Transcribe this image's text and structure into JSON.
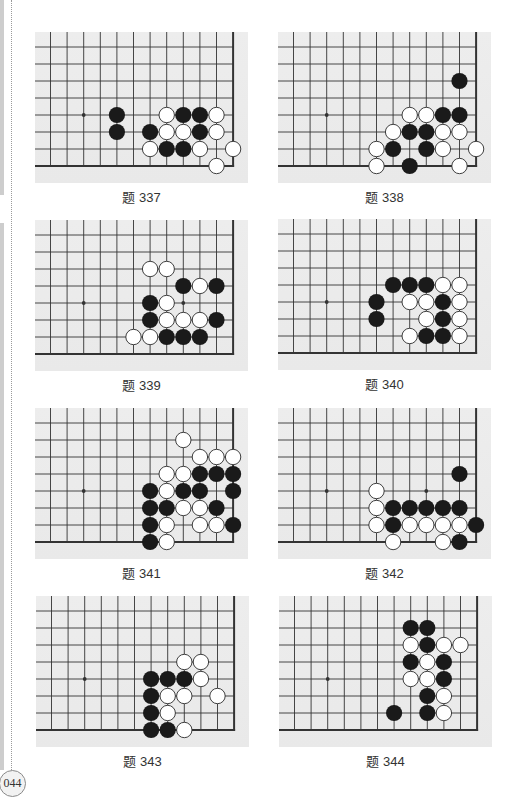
{
  "page": {
    "number": "044"
  },
  "colors": {
    "board": "#ebebeb",
    "line": "#333333",
    "black_stone": "#1a1a1a",
    "white_stone": "#ffffff",
    "stone_outline": "#2a2a2a"
  },
  "board_spec": {
    "columns": 12,
    "rows": 8,
    "edges": [
      "right",
      "bottom"
    ],
    "star_points": [
      [
        2,
        4
      ],
      [
        8,
        4
      ]
    ]
  },
  "problems": [
    {
      "caption": "题 337",
      "black": [
        [
          4,
          4
        ],
        [
          8,
          4
        ],
        [
          9,
          4
        ],
        [
          4,
          5
        ],
        [
          6,
          5
        ],
        [
          9,
          5
        ],
        [
          7,
          6
        ],
        [
          8,
          6
        ]
      ],
      "white": [
        [
          7,
          4
        ],
        [
          10,
          4
        ],
        [
          7,
          5
        ],
        [
          8,
          5
        ],
        [
          10,
          5
        ],
        [
          6,
          6
        ],
        [
          9,
          6
        ],
        [
          11,
          6
        ],
        [
          10,
          7
        ]
      ]
    },
    {
      "caption": "题 338",
      "black": [
        [
          10,
          2
        ],
        [
          9,
          4
        ],
        [
          10,
          4
        ],
        [
          7,
          5
        ],
        [
          8,
          5
        ],
        [
          6,
          6
        ],
        [
          8,
          6
        ],
        [
          7,
          7
        ]
      ],
      "white": [
        [
          7,
          4
        ],
        [
          8,
          4
        ],
        [
          6,
          5
        ],
        [
          9,
          5
        ],
        [
          10,
          5
        ],
        [
          5,
          6
        ],
        [
          9,
          6
        ],
        [
          11,
          6
        ],
        [
          5,
          7
        ],
        [
          10,
          7
        ]
      ]
    },
    {
      "caption": "题 339",
      "black": [
        [
          8,
          3
        ],
        [
          10,
          3
        ],
        [
          6,
          4
        ],
        [
          6,
          5
        ],
        [
          10,
          5
        ],
        [
          7,
          6
        ],
        [
          8,
          6
        ],
        [
          9,
          6
        ]
      ],
      "white": [
        [
          6,
          2
        ],
        [
          7,
          2
        ],
        [
          9,
          3
        ],
        [
          7,
          4
        ],
        [
          7,
          5
        ],
        [
          8,
          5
        ],
        [
          9,
          5
        ],
        [
          5,
          6
        ],
        [
          6,
          6
        ]
      ]
    },
    {
      "caption": "题 340",
      "black": [
        [
          6,
          3
        ],
        [
          7,
          3
        ],
        [
          8,
          3
        ],
        [
          5,
          4
        ],
        [
          9,
          4
        ],
        [
          5,
          5
        ],
        [
          9,
          5
        ],
        [
          8,
          6
        ],
        [
          9,
          6
        ]
      ],
      "white": [
        [
          9,
          3
        ],
        [
          10,
          3
        ],
        [
          7,
          4
        ],
        [
          8,
          4
        ],
        [
          10,
          4
        ],
        [
          8,
          5
        ],
        [
          10,
          5
        ],
        [
          7,
          6
        ],
        [
          10,
          6
        ]
      ]
    },
    {
      "caption": "题 341",
      "black": [
        [
          9,
          3
        ],
        [
          10,
          3
        ],
        [
          11,
          3
        ],
        [
          6,
          4
        ],
        [
          8,
          4
        ],
        [
          9,
          4
        ],
        [
          11,
          4
        ],
        [
          6,
          5
        ],
        [
          7,
          5
        ],
        [
          10,
          5
        ],
        [
          6,
          6
        ],
        [
          11,
          6
        ],
        [
          6,
          7
        ]
      ],
      "white": [
        [
          8,
          1
        ],
        [
          9,
          2
        ],
        [
          10,
          2
        ],
        [
          11,
          2
        ],
        [
          7,
          3
        ],
        [
          8,
          3
        ],
        [
          7,
          4
        ],
        [
          8,
          5
        ],
        [
          9,
          5
        ],
        [
          7,
          6
        ],
        [
          9,
          6
        ],
        [
          10,
          6
        ],
        [
          7,
          7
        ]
      ]
    },
    {
      "caption": "题 342",
      "black": [
        [
          10,
          3
        ],
        [
          6,
          5
        ],
        [
          7,
          5
        ],
        [
          8,
          5
        ],
        [
          9,
          5
        ],
        [
          10,
          5
        ],
        [
          6,
          6
        ],
        [
          11,
          6
        ],
        [
          10,
          7
        ]
      ],
      "white": [
        [
          5,
          4
        ],
        [
          5,
          5
        ],
        [
          5,
          6
        ],
        [
          7,
          6
        ],
        [
          8,
          6
        ],
        [
          9,
          6
        ],
        [
          10,
          6
        ],
        [
          6,
          7
        ],
        [
          9,
          7
        ]
      ]
    },
    {
      "caption": "题 343",
      "black": [
        [
          6,
          4
        ],
        [
          7,
          4
        ],
        [
          8,
          4
        ],
        [
          6,
          5
        ],
        [
          6,
          6
        ],
        [
          6,
          7
        ],
        [
          7,
          7
        ]
      ],
      "white": [
        [
          8,
          3
        ],
        [
          9,
          3
        ],
        [
          9,
          4
        ],
        [
          7,
          5
        ],
        [
          8,
          5
        ],
        [
          10,
          5
        ],
        [
          7,
          6
        ],
        [
          8,
          7
        ]
      ]
    },
    {
      "caption": "题 344",
      "black": [
        [
          7,
          1
        ],
        [
          8,
          1
        ],
        [
          8,
          2
        ],
        [
          7,
          3
        ],
        [
          9,
          3
        ],
        [
          9,
          4
        ],
        [
          8,
          5
        ],
        [
          6,
          6
        ],
        [
          8,
          6
        ]
      ],
      "white": [
        [
          7,
          2
        ],
        [
          9,
          2
        ],
        [
          10,
          2
        ],
        [
          8,
          3
        ],
        [
          7,
          4
        ],
        [
          8,
          4
        ],
        [
          9,
          5
        ],
        [
          9,
          6
        ]
      ]
    }
  ]
}
